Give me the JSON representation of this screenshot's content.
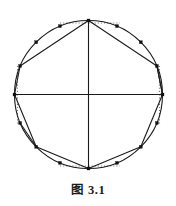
{
  "figure": {
    "caption": "图 3.1",
    "caption_label": "图",
    "caption_number": "3. 1",
    "background_color": "#ffffff",
    "stroke_color": "#1a1a1a",
    "marker_color": "#111111",
    "dotted_color": "#7a7a7a"
  },
  "geometry": {
    "canvas_width": 176,
    "canvas_height": 206,
    "circle": {
      "center_x": 88.5,
      "center_y": 94.5,
      "radius": 74.0,
      "stroke_width": 1.1
    },
    "axes": [
      {
        "name": "horizontal-diameter",
        "x1": 14.5,
        "y1": 94.5,
        "x2": 162.5,
        "y2": 94.5
      },
      {
        "name": "vertical-diameter",
        "x1": 88.5,
        "y1": 20.5,
        "x2": 88.5,
        "y2": 168.5
      }
    ],
    "cardinal_points": [
      {
        "name": "top",
        "x": 88.5,
        "y": 20.5
      },
      {
        "name": "right",
        "x": 162.5,
        "y": 94.5
      },
      {
        "name": "bottom",
        "x": 88.5,
        "y": 168.5
      },
      {
        "name": "left",
        "x": 14.5,
        "y": 94.5
      }
    ],
    "circumference_points": [
      {
        "index": 0,
        "angle_deg": 90,
        "x": 88.5,
        "y": 20.5,
        "is_cardinal": true
      },
      {
        "index": 1,
        "angle_deg": 67.5,
        "x": 117.0,
        "y": 26.1,
        "is_cardinal": false
      },
      {
        "index": 2,
        "angle_deg": 45,
        "x": 140.8,
        "y": 42.2,
        "is_cardinal": false
      },
      {
        "index": 3,
        "angle_deg": 22.5,
        "x": 156.9,
        "y": 66.0,
        "is_cardinal": false
      },
      {
        "index": 4,
        "angle_deg": 0,
        "x": 162.5,
        "y": 94.5,
        "is_cardinal": true
      },
      {
        "index": 5,
        "angle_deg": 337.5,
        "x": 156.9,
        "y": 123.0,
        "is_cardinal": false
      },
      {
        "index": 6,
        "angle_deg": 315,
        "x": 140.8,
        "y": 146.8,
        "is_cardinal": false
      },
      {
        "index": 7,
        "angle_deg": 292.5,
        "x": 117.0,
        "y": 162.9,
        "is_cardinal": false
      },
      {
        "index": 8,
        "angle_deg": 270,
        "x": 88.5,
        "y": 168.5,
        "is_cardinal": true
      },
      {
        "index": 9,
        "angle_deg": 247.5,
        "x": 60.0,
        "y": 162.9,
        "is_cardinal": false
      },
      {
        "index": 10,
        "angle_deg": 225,
        "x": 36.2,
        "y": 146.8,
        "is_cardinal": false
      },
      {
        "index": 11,
        "angle_deg": 202.5,
        "x": 20.1,
        "y": 123.0,
        "is_cardinal": false
      },
      {
        "index": 12,
        "angle_deg": 180,
        "x": 14.5,
        "y": 94.5,
        "is_cardinal": true
      },
      {
        "index": 13,
        "angle_deg": 157.5,
        "x": 20.1,
        "y": 66.0,
        "is_cardinal": false
      },
      {
        "index": 14,
        "angle_deg": 135,
        "x": 36.2,
        "y": 42.2,
        "is_cardinal": false
      },
      {
        "index": 15,
        "angle_deg": 112.5,
        "x": 60.0,
        "y": 26.1,
        "is_cardinal": false
      }
    ],
    "marker_size": 3.0,
    "chords": [
      {
        "name": "chord-top-to-upper-right",
        "x1": 88.5,
        "y1": 20.5,
        "x2": 156.9,
        "y2": 66.0
      },
      {
        "name": "chord-upper-right-to-right",
        "x1": 156.9,
        "y1": 66.0,
        "x2": 162.5,
        "y2": 94.5
      },
      {
        "name": "chord-right-to-lower-right",
        "x1": 162.5,
        "y1": 94.5,
        "x2": 140.8,
        "y2": 146.8
      },
      {
        "name": "chord-lower-right-to-bottom",
        "x1": 140.8,
        "y1": 146.8,
        "x2": 88.5,
        "y2": 168.5
      },
      {
        "name": "chord-bottom-to-lower-left",
        "x1": 88.5,
        "y1": 168.5,
        "x2": 36.2,
        "y2": 146.8
      },
      {
        "name": "chord-lower-left-to-left",
        "x1": 36.2,
        "y1": 146.8,
        "x2": 20.1,
        "y2": 123.0
      },
      {
        "name": "chord-left-to-upper-left",
        "x1": 14.5,
        "y1": 94.5,
        "x2": 20.1,
        "y2": 66.0
      },
      {
        "name": "chord-upper-left-to-top",
        "x1": 20.1,
        "y1": 66.0,
        "x2": 88.5,
        "y2": 20.5
      },
      {
        "name": "chord-left-to-lower-left-long",
        "x1": 14.5,
        "y1": 94.5,
        "x2": 36.2,
        "y2": 146.8
      },
      {
        "name": "chord-right-to-upper-right-long",
        "x1": 162.5,
        "y1": 94.5,
        "x2": 156.9,
        "y2": 66.0
      }
    ],
    "dotted_guides": [
      {
        "name": "dotted-top-left-horizontal",
        "x1": 60.0,
        "y1": 23.0,
        "x2": 88.5,
        "y2": 23.0
      },
      {
        "name": "dotted-top-right-horizontal",
        "x1": 88.5,
        "y1": 23.0,
        "x2": 120.0,
        "y2": 23.0
      },
      {
        "name": "dotted-bottom-left-horizontal",
        "x1": 60.0,
        "y1": 166.0,
        "x2": 88.5,
        "y2": 166.0
      },
      {
        "name": "dotted-bottom-right-horizontal",
        "x1": 88.5,
        "y1": 166.0,
        "x2": 120.0,
        "y2": 166.0
      },
      {
        "name": "dotted-left-upper-vertical",
        "x1": 17.5,
        "y1": 66.0,
        "x2": 17.5,
        "y2": 94.5
      },
      {
        "name": "dotted-left-lower-vertical",
        "x1": 17.5,
        "y1": 94.5,
        "x2": 17.5,
        "y2": 124.0
      },
      {
        "name": "dotted-right-upper-vertical",
        "x1": 159.5,
        "y1": 66.0,
        "x2": 159.5,
        "y2": 94.5
      },
      {
        "name": "dotted-right-lower-vertical",
        "x1": 159.5,
        "y1": 94.5,
        "x2": 159.5,
        "y2": 124.0
      }
    ]
  }
}
